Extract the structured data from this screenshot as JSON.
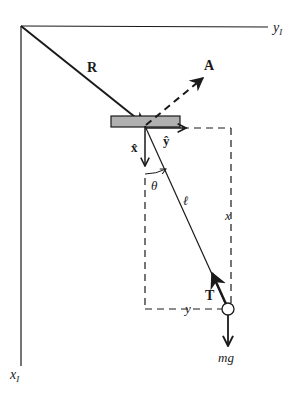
{
  "diagram": {
    "colors": {
      "ink": "#1a1a1a",
      "support_fill": "#b0b0b0",
      "background": "#ffffff"
    },
    "axes": {
      "x_axis_label": "x",
      "x_axis_subscript": "I",
      "y_axis_label": "y",
      "y_axis_subscript": "I"
    },
    "vectors": {
      "position": "R",
      "acceleration": "A",
      "tension": "T",
      "weight": "mg"
    },
    "unit_vectors": {
      "x_hat": "x̂",
      "y_hat": "ŷ"
    },
    "quantities": {
      "angle": "θ",
      "length": "ℓ",
      "vertical_displacement": "x",
      "horizontal_displacement": "y"
    }
  }
}
